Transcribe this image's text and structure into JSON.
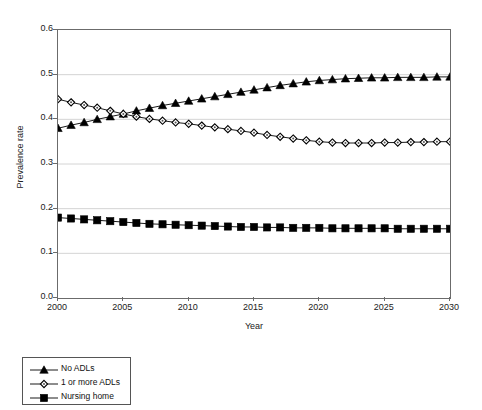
{
  "chart_data": {
    "type": "line",
    "title": "",
    "xlabel": "Year",
    "ylabel": "Prevalence rate",
    "xlim": [
      2000,
      2030
    ],
    "ylim": [
      0.0,
      0.6
    ],
    "xticks": [
      2000,
      2005,
      2010,
      2015,
      2020,
      2025,
      2030
    ],
    "xtick_labels": [
      "2000",
      "2005",
      "2010",
      "2015",
      "2020",
      "2025",
      "2030"
    ],
    "yticks": [
      0.0,
      0.1,
      0.2,
      0.3,
      0.4,
      0.5,
      0.6
    ],
    "ytick_labels": [
      "0.0",
      "0.1",
      "0.2",
      "0.3",
      "0.4",
      "0.5",
      "0.6"
    ],
    "grid": "horizontal",
    "legend_position": "below-left",
    "x": [
      2000,
      2001,
      2002,
      2003,
      2004,
      2005,
      2006,
      2007,
      2008,
      2009,
      2010,
      2011,
      2012,
      2013,
      2014,
      2015,
      2016,
      2017,
      2018,
      2019,
      2020,
      2021,
      2022,
      2023,
      2024,
      2025,
      2026,
      2027,
      2028,
      2029,
      2030
    ],
    "series": [
      {
        "name": "No ADLs",
        "marker": "filled-triangle",
        "color": "#000000",
        "values": [
          0.38,
          0.387,
          0.393,
          0.4,
          0.406,
          0.412,
          0.419,
          0.425,
          0.431,
          0.436,
          0.441,
          0.446,
          0.451,
          0.456,
          0.461,
          0.466,
          0.471,
          0.476,
          0.48,
          0.484,
          0.487,
          0.489,
          0.491,
          0.492,
          0.493,
          0.493,
          0.494,
          0.494,
          0.494,
          0.495,
          0.495
        ]
      },
      {
        "name": "1 or more ADLs",
        "marker": "open-diamond",
        "color": "#000000",
        "values": [
          0.445,
          0.438,
          0.432,
          0.426,
          0.419,
          0.412,
          0.406,
          0.401,
          0.397,
          0.393,
          0.39,
          0.386,
          0.382,
          0.378,
          0.374,
          0.37,
          0.365,
          0.361,
          0.357,
          0.353,
          0.35,
          0.348,
          0.347,
          0.347,
          0.347,
          0.348,
          0.348,
          0.349,
          0.349,
          0.35,
          0.35
        ]
      },
      {
        "name": "Nursing home",
        "marker": "filled-square",
        "color": "#000000",
        "values": [
          0.18,
          0.178,
          0.176,
          0.174,
          0.172,
          0.17,
          0.168,
          0.166,
          0.165,
          0.164,
          0.163,
          0.162,
          0.161,
          0.16,
          0.159,
          0.159,
          0.158,
          0.158,
          0.157,
          0.157,
          0.157,
          0.156,
          0.156,
          0.156,
          0.156,
          0.156,
          0.155,
          0.155,
          0.155,
          0.155,
          0.155
        ]
      }
    ]
  },
  "legend": {
    "entries": [
      {
        "label": "No ADLs",
        "marker": "filled-triangle"
      },
      {
        "label": "1 or more ADLs",
        "marker": "open-diamond"
      },
      {
        "label": "Nursing home",
        "marker": "filled-square"
      }
    ]
  }
}
